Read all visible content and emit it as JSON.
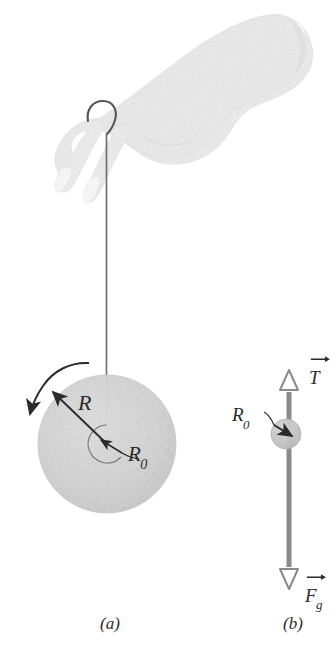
{
  "figure": {
    "background_color": "#ffffff",
    "ink_color": "#2b2b2b",
    "hand_fill": "#e9e9e9",
    "disk_fill": "#d8d8d8",
    "shaft_color": "#8a8a8a",
    "string_color": "#6f6f6f"
  },
  "panel_a": {
    "caption": "(a)",
    "radius_label": "R",
    "axle_label_main": "R",
    "axle_label_sub": "0",
    "description": "A hand holds a string looped over the middle finger; the string descends to a spinning yo-yo disk."
  },
  "panel_b": {
    "caption": "(b)",
    "axle_label_main": "R",
    "axle_label_sub": "0",
    "tension_label": "T",
    "gravity_label_main": "F",
    "gravity_label_sub": "g",
    "description": "Free-body diagram: tension T acts upward along the string, gravitational force F_g acts downward."
  }
}
